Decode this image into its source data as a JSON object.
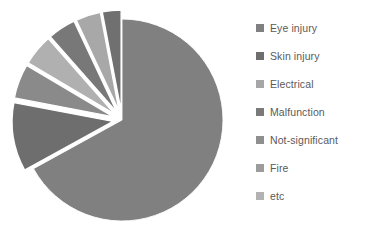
{
  "chart_data": {
    "type": "pie",
    "title": "",
    "legend_position": "right",
    "exploded": true,
    "start_angle_deg": 0,
    "categories": [
      "Eye injury",
      "Skin injury",
      "Electrical",
      "Malfunction",
      "Not-significant",
      "Fire",
      "etc"
    ],
    "values": [
      67.0,
      11.0,
      5.5,
      5.0,
      4.5,
      4.0,
      3.0
    ],
    "colors": [
      "#808080",
      "#6e6e6e",
      "#8a8a8a",
      "#b0b0b0",
      "#787878",
      "#a8a8a8",
      "#707070"
    ],
    "slices": [
      {
        "label": "Eye injury",
        "value": 67.0,
        "color": "#808080",
        "exploded": false
      },
      {
        "label": "Skin injury",
        "value": 11.0,
        "color": "#6e6e6e",
        "exploded": true
      },
      {
        "label": "Electrical",
        "value": 5.5,
        "color": "#8a8a8a",
        "exploded": true
      },
      {
        "label": "Malfunction",
        "value": 5.0,
        "color": "#b0b0b0",
        "exploded": true
      },
      {
        "label": "Not-significant",
        "value": 4.5,
        "color": "#787878",
        "exploded": true
      },
      {
        "label": "Fire",
        "value": 4.0,
        "color": "#a8a8a8",
        "exploded": true
      },
      {
        "label": "etc",
        "value": 3.0,
        "color": "#707070",
        "exploded": true
      }
    ]
  },
  "legend": {
    "items": [
      {
        "label": "Eye injury",
        "color": "#808080"
      },
      {
        "label": "Skin injury",
        "color": "#6e6e6e"
      },
      {
        "label": "Electrical",
        "color": "#a6a6a6"
      },
      {
        "label": "Malfunction",
        "color": "#7a7a7a"
      },
      {
        "label": "Not-significant",
        "color": "#8f8f8f"
      },
      {
        "label": "Fire",
        "color": "#9c9c9c"
      },
      {
        "label": "etc",
        "color": "#b2b2b2"
      }
    ]
  }
}
